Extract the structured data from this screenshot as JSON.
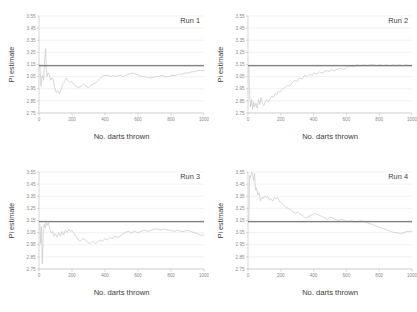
{
  "figure": {
    "xlabel": "No. darts thrown",
    "ylabel": "Pi estimate"
  },
  "chart_data": [
    {
      "type": "line",
      "title": "Run 1",
      "xlabel": "No. darts thrown",
      "ylabel": "Pi estimate",
      "xlim": [
        0,
        1000
      ],
      "ylim": [
        2.75,
        3.55
      ],
      "xticks": [
        0,
        200,
        400,
        600,
        800,
        1000
      ],
      "yticks": [
        2.75,
        2.85,
        2.95,
        3.05,
        3.15,
        3.25,
        3.35,
        3.45,
        3.55
      ],
      "grid": true,
      "legend": "none",
      "reference_line": {
        "label": "pi",
        "value": 3.14,
        "color": "#5a5a5a"
      },
      "series": [
        {
          "name": "Pi estimate",
          "color": "#c9c9c9",
          "x": [
            5,
            12,
            20,
            28,
            34,
            40,
            44,
            48,
            55,
            62,
            70,
            78,
            86,
            95,
            105,
            115,
            125,
            135,
            145,
            155,
            165,
            175,
            185,
            195,
            205,
            215,
            225,
            240,
            255,
            270,
            285,
            300,
            315,
            330,
            345,
            360,
            375,
            390,
            405,
            420,
            435,
            450,
            465,
            480,
            495,
            510,
            525,
            545,
            565,
            585,
            605,
            625,
            645,
            665,
            685,
            705,
            725,
            745,
            765,
            785,
            805,
            825,
            845,
            865,
            885,
            905,
            925,
            945,
            965,
            985,
            1000
          ],
          "values": [
            3.15,
            2.97,
            3.06,
            3.02,
            3.18,
            3.28,
            3.13,
            3.05,
            3.08,
            3.07,
            3.02,
            3.04,
            3.03,
            2.96,
            2.92,
            2.93,
            2.91,
            2.95,
            2.99,
            3.01,
            3.04,
            3.02,
            3.0,
            3.01,
            3.0,
            2.98,
            2.97,
            2.96,
            2.97,
            2.99,
            2.97,
            2.96,
            2.98,
            2.99,
            3.0,
            3.02,
            3.04,
            3.06,
            3.06,
            3.06,
            3.05,
            3.06,
            3.05,
            3.06,
            3.06,
            3.05,
            3.06,
            3.07,
            3.08,
            3.07,
            3.06,
            3.05,
            3.05,
            3.04,
            3.04,
            3.05,
            3.05,
            3.06,
            3.05,
            3.05,
            3.06,
            3.06,
            3.07,
            3.07,
            3.08,
            3.08,
            3.09,
            3.09,
            3.1,
            3.1,
            3.1
          ]
        }
      ]
    },
    {
      "type": "line",
      "title": "Run 2",
      "xlabel": "No. darts thrown",
      "ylabel": "Pi estimate",
      "xlim": [
        0,
        1000
      ],
      "ylim": [
        2.75,
        3.55
      ],
      "xticks": [
        0,
        200,
        400,
        600,
        800,
        1000
      ],
      "yticks": [
        2.75,
        2.85,
        2.95,
        3.05,
        3.15,
        3.25,
        3.35,
        3.45,
        3.55
      ],
      "grid": true,
      "legend": "none",
      "reference_line": {
        "label": "pi",
        "value": 3.14,
        "color": "#5a5a5a"
      },
      "series": [
        {
          "name": "Pi estimate",
          "color": "#c9c9c9",
          "x": [
            5,
            10,
            16,
            22,
            28,
            34,
            40,
            48,
            56,
            64,
            72,
            80,
            88,
            96,
            105,
            115,
            125,
            135,
            145,
            155,
            165,
            175,
            185,
            195,
            210,
            225,
            240,
            255,
            270,
            285,
            300,
            315,
            330,
            345,
            360,
            375,
            390,
            405,
            420,
            435,
            450,
            465,
            480,
            495,
            510,
            525,
            545,
            565,
            585,
            605,
            625,
            645,
            665,
            685,
            705,
            725,
            745,
            765,
            785,
            805,
            825,
            845,
            865,
            885,
            905,
            925,
            945,
            965,
            985,
            1000
          ],
          "values": [
            3.13,
            2.9,
            2.8,
            2.86,
            2.78,
            2.84,
            2.8,
            2.83,
            2.79,
            2.86,
            2.82,
            2.88,
            2.83,
            2.81,
            2.84,
            2.86,
            2.84,
            2.87,
            2.89,
            2.88,
            2.91,
            2.9,
            2.93,
            2.92,
            2.95,
            2.96,
            2.98,
            2.97,
            3.0,
            3.02,
            3.01,
            3.04,
            3.03,
            3.06,
            3.05,
            3.07,
            3.06,
            3.08,
            3.07,
            3.09,
            3.08,
            3.09,
            3.1,
            3.09,
            3.11,
            3.1,
            3.11,
            3.12,
            3.11,
            3.13,
            3.14,
            3.13,
            3.15,
            3.14,
            3.15,
            3.14,
            3.15,
            3.15,
            3.14,
            3.15,
            3.14,
            3.15,
            3.14,
            3.15,
            3.14,
            3.15,
            3.14,
            3.15,
            3.14,
            3.14
          ]
        }
      ]
    },
    {
      "type": "line",
      "title": "Run 3",
      "xlabel": "No. darts thrown",
      "ylabel": "Pi estimate",
      "xlim": [
        0,
        1000
      ],
      "ylim": [
        2.75,
        3.55
      ],
      "xticks": [
        0,
        200,
        400,
        600,
        800,
        1000
      ],
      "yticks": [
        2.75,
        2.85,
        2.95,
        3.05,
        3.15,
        3.25,
        3.35,
        3.45,
        3.55
      ],
      "grid": true,
      "legend": "none",
      "reference_line": {
        "label": "pi",
        "value": 3.14,
        "color": "#5a5a5a"
      },
      "series": [
        {
          "name": "Pi estimate",
          "color": "#c9c9c9",
          "x": [
            5,
            10,
            15,
            20,
            26,
            32,
            38,
            44,
            50,
            58,
            66,
            74,
            82,
            90,
            100,
            110,
            120,
            130,
            140,
            150,
            160,
            170,
            180,
            190,
            200,
            212,
            224,
            236,
            250,
            265,
            280,
            295,
            310,
            325,
            340,
            355,
            370,
            385,
            400,
            415,
            430,
            445,
            460,
            480,
            500,
            520,
            540,
            560,
            580,
            600,
            620,
            640,
            660,
            680,
            700,
            720,
            740,
            760,
            780,
            800,
            820,
            840,
            860,
            880,
            900,
            920,
            940,
            960,
            980,
            1000
          ],
          "values": [
            3.12,
            2.96,
            3.1,
            2.79,
            3.05,
            3.12,
            3.09,
            3.13,
            3.11,
            3.13,
            3.08,
            3.05,
            3.06,
            3.02,
            3.04,
            3.01,
            3.05,
            3.02,
            3.06,
            3.03,
            3.07,
            3.05,
            3.08,
            3.06,
            3.07,
            3.04,
            3.02,
            2.99,
            2.98,
            3.0,
            2.99,
            2.97,
            2.96,
            2.98,
            2.96,
            2.97,
            2.99,
            2.98,
            3.0,
            2.99,
            3.01,
            3.0,
            3.02,
            3.01,
            3.03,
            3.05,
            3.06,
            3.05,
            3.06,
            3.05,
            3.06,
            3.07,
            3.06,
            3.07,
            3.08,
            3.08,
            3.07,
            3.08,
            3.07,
            3.07,
            3.06,
            3.07,
            3.06,
            3.06,
            3.07,
            3.06,
            3.05,
            3.04,
            3.03,
            3.03
          ]
        }
      ]
    },
    {
      "type": "line",
      "title": "Run 4",
      "xlabel": "No. darts thrown",
      "ylabel": "Pi estimate",
      "xlim": [
        0,
        1000
      ],
      "ylim": [
        2.75,
        3.55
      ],
      "xticks": [
        0,
        200,
        400,
        600,
        800,
        1000
      ],
      "yticks": [
        2.75,
        2.85,
        2.95,
        3.05,
        3.15,
        3.25,
        3.35,
        3.45,
        3.55
      ],
      "grid": true,
      "legend": "none",
      "reference_line": {
        "label": "pi",
        "value": 3.14,
        "color": "#5a5a5a"
      },
      "series": [
        {
          "name": "Pi estimate",
          "color": "#c9c9c9",
          "x": [
            5,
            10,
            16,
            22,
            28,
            34,
            40,
            46,
            52,
            60,
            68,
            76,
            84,
            92,
            100,
            110,
            120,
            130,
            140,
            150,
            160,
            170,
            180,
            190,
            200,
            215,
            230,
            245,
            260,
            275,
            290,
            305,
            320,
            335,
            350,
            365,
            380,
            395,
            410,
            425,
            440,
            455,
            470,
            485,
            500,
            515,
            530,
            550,
            570,
            590,
            610,
            630,
            650,
            670,
            690,
            710,
            730,
            750,
            770,
            790,
            810,
            830,
            850,
            870,
            890,
            910,
            930,
            950,
            970,
            990,
            1000
          ],
          "values": [
            3.15,
            3.52,
            3.5,
            3.55,
            3.53,
            3.48,
            3.54,
            3.4,
            3.42,
            3.36,
            3.38,
            3.31,
            3.34,
            3.33,
            3.35,
            3.34,
            3.35,
            3.32,
            3.33,
            3.31,
            3.34,
            3.33,
            3.34,
            3.31,
            3.3,
            3.28,
            3.26,
            3.25,
            3.24,
            3.22,
            3.21,
            3.22,
            3.2,
            3.19,
            3.17,
            3.18,
            3.19,
            3.2,
            3.21,
            3.2,
            3.19,
            3.18,
            3.17,
            3.16,
            3.18,
            3.17,
            3.16,
            3.15,
            3.16,
            3.15,
            3.14,
            3.15,
            3.14,
            3.14,
            3.15,
            3.14,
            3.13,
            3.12,
            3.11,
            3.1,
            3.09,
            3.08,
            3.07,
            3.06,
            3.05,
            3.05,
            3.04,
            3.05,
            3.06,
            3.06,
            3.06
          ]
        }
      ]
    }
  ]
}
